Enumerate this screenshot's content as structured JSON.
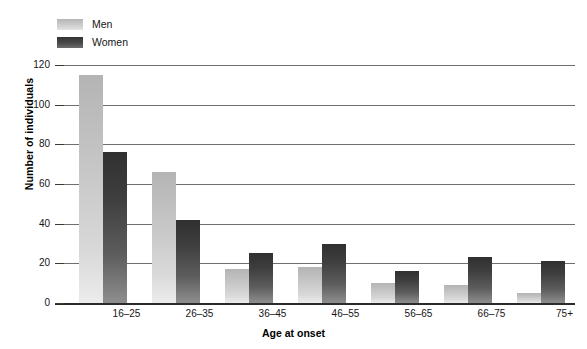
{
  "chart_data": {
    "type": "bar",
    "title": "",
    "xlabel": "Age at onset",
    "ylabel": "Number of individuals",
    "categories": [
      "16–25",
      "26–35",
      "36–45",
      "46–55",
      "56–65",
      "66–75",
      "75+"
    ],
    "series": [
      {
        "name": "Men",
        "color": "#c6c6c6",
        "values": [
          115,
          66,
          17,
          18,
          10,
          9,
          5
        ]
      },
      {
        "name": "Women",
        "color": "#3e3e3e",
        "values": [
          76,
          42,
          25,
          30,
          16,
          23,
          21
        ]
      }
    ],
    "ylim": [
      0,
      120
    ],
    "ytick_labels": [
      "0",
      "20",
      "40",
      "60",
      "80",
      "100",
      "120"
    ],
    "ytick_values": [
      0,
      20,
      40,
      60,
      80,
      100,
      120
    ],
    "grid": true,
    "grid_axis": "y",
    "legend_position": "top-left",
    "legend_entries": [
      "Men",
      "Women"
    ]
  }
}
